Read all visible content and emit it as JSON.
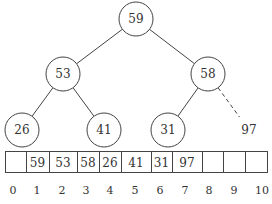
{
  "tree": {
    "nodes": [
      {
        "id": "n1",
        "value": "59"
      },
      {
        "id": "n2",
        "value": "53"
      },
      {
        "id": "n3",
        "value": "58"
      },
      {
        "id": "n4",
        "value": "26"
      },
      {
        "id": "n5",
        "value": "41"
      },
      {
        "id": "n6",
        "value": "31"
      }
    ],
    "pending": {
      "id": "n7",
      "value": "97"
    },
    "edges": [
      {
        "from": "n1",
        "to": "n2",
        "style": "solid"
      },
      {
        "from": "n1",
        "to": "n3",
        "style": "solid"
      },
      {
        "from": "n2",
        "to": "n4",
        "style": "solid"
      },
      {
        "from": "n2",
        "to": "n5",
        "style": "solid"
      },
      {
        "from": "n3",
        "to": "n6",
        "style": "solid"
      },
      {
        "from": "n3",
        "to": "n7",
        "style": "dashed"
      }
    ]
  },
  "array": {
    "cells": [
      "",
      "59",
      "53",
      "58",
      "26",
      "41",
      "31",
      "97",
      "",
      "",
      ""
    ],
    "indices": [
      "0",
      "1",
      "2",
      "3",
      "4",
      "5",
      "6",
      "7",
      "8",
      "9",
      "10"
    ]
  }
}
